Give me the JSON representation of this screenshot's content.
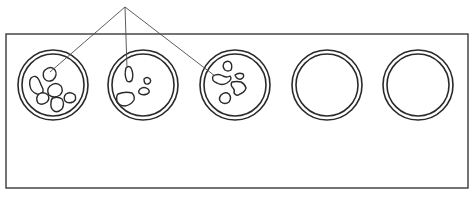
{
  "diagram": {
    "plate": {
      "x": 6,
      "y": 34,
      "width": 462,
      "height": 154
    },
    "callout_apex": {
      "x": 125,
      "y": 7
    },
    "wells": [
      {
        "id": "well-1",
        "cx": 53,
        "cy": 85,
        "r_outer": 35,
        "r_inner": 31,
        "state": "filled",
        "particles": [
          "M45,70 q6,-5 10,0 q3,5 -2,10 q-6,3 -9,-2 q-2,-5 1,-8 z",
          "M31,78 q5,-4 8,2 q2,5 4,9 q1,6 -6,5 q-6,-2 -7,-8 q-1,-5 1,-8 z",
          "M50,86 q6,-5 11,0 q3,5 -1,9 q-6,4 -11,0 q-3,-5 1,-9 z",
          "M39,94 q5,-3 9,1 q2,4 -1,7 q-5,4 -9,1 q-3,-5 1,-9 z",
          "M53,98 q5,-2 9,1 q3,5 0,10 q-4,4 -8,2 q-4,-3 -3,-8 q0,-4 2,-5 z",
          "M66,94 q5,-3 9,1 q2,5 -2,7 q-5,2 -8,-1 q-2,-4 1,-7 z"
        ],
        "callout_target": {
          "x": 50,
          "y": 72
        }
      },
      {
        "id": "well-2",
        "cx": 143,
        "cy": 85,
        "r_outer": 35,
        "r_inner": 31,
        "state": "filled",
        "particles": [
          "M126,68 q3,-3 5,0 q3,6 1,12 q-2,3 -5,1 q-3,-6 -1,-13 z",
          "M144,79 q3,-3 6,0 q2,3 -2,5 q-4,1 -4,-5 z",
          "M140,89 q4,-3 8,0 q3,3 -1,5 q-5,2 -8,-1 q-1,-2 1,-4 z",
          "M118,94 q7,-3 14,-1 q3,3 2,7 q-3,5 -9,6 q-6,0 -8,-5 q-1,-5 1,-7 z"
        ],
        "callout_target": {
          "x": 127,
          "y": 68
        }
      },
      {
        "id": "well-3",
        "cx": 235,
        "cy": 85,
        "r_outer": 35,
        "r_inner": 31,
        "state": "filled",
        "particles": [
          "M224,63 q3,-3 6,-1 q3,3 1,8 q-3,2 -6,0 q-3,-3 -1,-7 z",
          "M213,76 q5,-3 10,0 q4,2 7,0 q3,3 -3,7 q-5,3 -10,0 q-6,-2 -4,-7 z",
          "M235,75 q4,-3 8,-1 q2,3 -2,5 q-4,1 -6,-4 z",
          "M232,82 q5,-1 9,0 q4,2 5,6 q-1,4 -6,6 q-3,3 -6,-1 q1,-3 -1,-5 q-3,-3 -1,-6 z",
          "M221,95 q4,-4 8,-1 q3,4 0,8 q-4,3 -8,0 q-3,-3 0,-7 z"
        ],
        "callout_target": {
          "x": 215,
          "y": 76
        }
      },
      {
        "id": "well-4",
        "cx": 327,
        "cy": 85,
        "r_outer": 35,
        "r_inner": 31,
        "state": "empty",
        "particles": []
      },
      {
        "id": "well-5",
        "cx": 418,
        "cy": 85,
        "r_outer": 35,
        "r_inner": 31,
        "state": "empty",
        "particles": []
      }
    ],
    "colors": {
      "stroke": "#2a2a2a",
      "plate_stroke": "#3a3a3a",
      "callout": "#4a4a4a",
      "background": "#ffffff"
    }
  }
}
